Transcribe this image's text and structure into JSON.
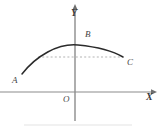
{
  "figure": {
    "type": "coordinate-geometry-diagram",
    "background_color": "#ffffff",
    "axes": {
      "x_axis_label": "X",
      "y_axis_label": "Y",
      "origin_label": "O",
      "axis_color": "#8c8c8c",
      "x_axis_y_px": 92,
      "y_axis_x_px": 75,
      "x_axis_start_px": 0,
      "x_axis_end_px": 152,
      "y_axis_top_px": 6,
      "y_axis_bottom_px": 121,
      "arrowheads": [
        "x-positive",
        "y-positive"
      ]
    },
    "curve": {
      "name": "parabolic-arc",
      "color": "#2b2b2b",
      "stroke_width": 1.4,
      "style": "solid",
      "start_point": "A",
      "apex_label": "B",
      "end_point": "C",
      "path": "M 22 74 Q 50 40 78 45 Q 106 49 123 57"
    },
    "chord": {
      "name": "dashed-chord",
      "color": "#b0b0b0",
      "style": "dotted",
      "stroke_width": 1,
      "y_px": 57,
      "x_start_px": 38,
      "x_end_px": 122
    },
    "points": [
      {
        "id": "A",
        "label": "A",
        "label_x_px": 12,
        "label_y_px": 76,
        "position": "lower-left end of arc"
      },
      {
        "id": "B",
        "label": "B",
        "label_x_px": 85,
        "label_y_px": 30,
        "position": "upper area near arc apex, right of y-axis"
      },
      {
        "id": "C",
        "label": "C",
        "label_x_px": 127,
        "label_y_px": 58,
        "position": "lower-right end of arc"
      }
    ]
  }
}
